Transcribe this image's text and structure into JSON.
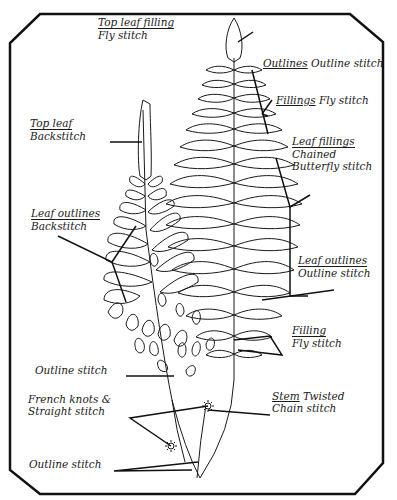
{
  "diagram": {
    "type": "embroidery stitch guide",
    "frame_color": "#111111",
    "line_color": "#1a1a1a",
    "background": "#ffffff"
  },
  "labels": {
    "top_leaf_filling": {
      "title": "Top leaf filling",
      "stitch": "Fly stitch"
    },
    "outlines": {
      "title": "Outlines",
      "stitch": "Outline stitch"
    },
    "fillings": {
      "title": "Fillings",
      "stitch": "Fly stitch"
    },
    "top_leaf": {
      "title": "Top leaf",
      "stitch": "Backstitch"
    },
    "leaf_fillings": {
      "title": "Leaf fillings",
      "stitch_line1": "Chained",
      "stitch_line2": "Butterfly stitch"
    },
    "leaf_outlines_left": {
      "title": "Leaf outlines",
      "stitch": "Backstitch"
    },
    "leaf_outlines_right": {
      "title": "Leaf outlines",
      "stitch": "Outline stitch"
    },
    "filling": {
      "title": "Filling",
      "stitch": "Fly stitch"
    },
    "outline_stitch_mid": {
      "stitch": "Outline stitch"
    },
    "french_knots": {
      "line1": "French knots &",
      "line2": "Straight stitch"
    },
    "stem": {
      "title": "Stem",
      "stitch_line1": "Twisted",
      "stitch_line2": "Chain stitch"
    },
    "outline_stitch_bottom": {
      "stitch": "Outline stitch"
    }
  }
}
